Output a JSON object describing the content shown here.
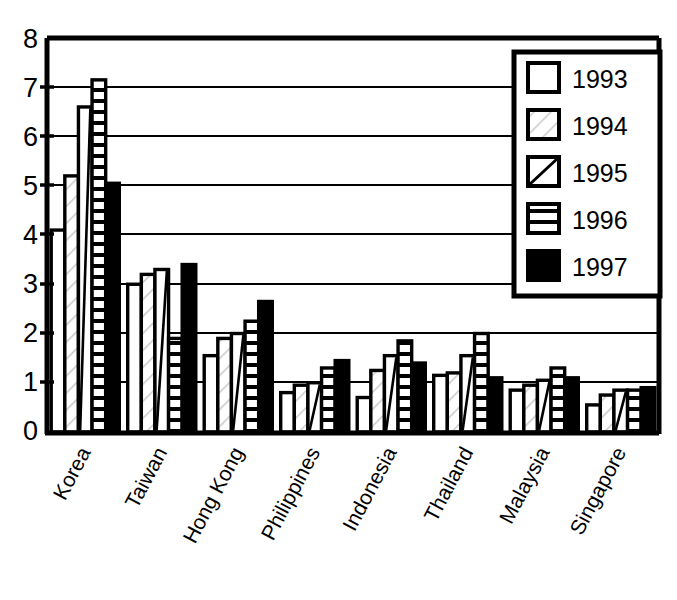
{
  "chart_data": {
    "type": "bar",
    "title": "",
    "subtitle": "",
    "xlabel": "",
    "ylabel": "",
    "ylim": [
      0,
      8
    ],
    "yticks": [
      "0",
      "1",
      "2",
      "3",
      "4",
      "5",
      "6",
      "7",
      "8"
    ],
    "grid": true,
    "legend_position": "top-right",
    "categories": [
      "Korea",
      "Taiwan",
      "Hong Kong",
      "Philippines",
      "Indonesia",
      "Thailand",
      "Malaysia",
      "Singapore"
    ],
    "series": [
      {
        "name": "1993",
        "fill": "white",
        "values": [
          4.1,
          3.0,
          1.55,
          0.8,
          0.7,
          1.15,
          0.85,
          0.55
        ]
      },
      {
        "name": "1994",
        "fill": "light-hatch",
        "values": [
          5.2,
          3.2,
          1.9,
          0.95,
          1.25,
          1.2,
          0.95,
          0.75
        ]
      },
      {
        "name": "1995",
        "fill": "diagonal",
        "values": [
          6.6,
          3.3,
          2.0,
          1.0,
          1.55,
          1.55,
          1.05,
          0.85
        ]
      },
      {
        "name": "1996",
        "fill": "horizontal",
        "values": [
          7.15,
          1.9,
          2.25,
          1.3,
          1.85,
          2.0,
          1.3,
          0.85
        ]
      },
      {
        "name": "1997",
        "fill": "solid-black",
        "values": [
          5.05,
          3.4,
          2.65,
          1.45,
          1.4,
          1.1,
          1.1,
          0.9
        ]
      }
    ]
  },
  "legend": {
    "entries": [
      {
        "label": "1993",
        "swatch": "swatch-white-icon"
      },
      {
        "label": "1994",
        "swatch": "swatch-light-hatch-icon"
      },
      {
        "label": "1995",
        "swatch": "swatch-diagonal-icon"
      },
      {
        "label": "1996",
        "swatch": "swatch-horizontal-icon"
      },
      {
        "label": "1997",
        "swatch": "swatch-solid-black-icon"
      }
    ]
  },
  "colors": {
    "axis": "#000000",
    "grid": "#000000",
    "bar_stroke": "#000000",
    "bar_fill_empty": "#ffffff",
    "bar_fill_solid": "#000000",
    "background": "#ffffff"
  }
}
